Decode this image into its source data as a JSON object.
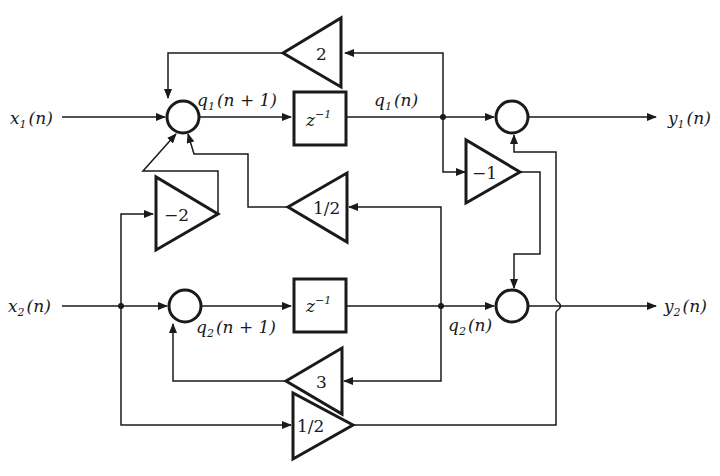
{
  "diagram": {
    "type": "state-variable block diagram (two inputs, two outputs, two delays)",
    "inputs": [
      {
        "var": "x",
        "sub": "1",
        "arg": "(n)"
      },
      {
        "var": "x",
        "sub": "2",
        "arg": "(n)"
      }
    ],
    "outputs": [
      {
        "var": "y",
        "sub": "1",
        "arg": "(n)"
      },
      {
        "var": "y",
        "sub": "2",
        "arg": "(n)"
      }
    ],
    "states": {
      "q1_next": {
        "var": "q",
        "sub": "1",
        "arg": "(n + 1)"
      },
      "q1": {
        "var": "q",
        "sub": "1",
        "arg": "(n)"
      },
      "q2_next": {
        "var": "q",
        "sub": "2",
        "arg": "(n + 1)"
      },
      "q2": {
        "var": "q",
        "sub": "2",
        "arg": "(n)"
      }
    },
    "delays": [
      {
        "label": "z",
        "exp": "−1"
      },
      {
        "label": "z",
        "exp": "−1"
      }
    ],
    "gains": {
      "g_q1_to_s1": "2",
      "g_q2_to_s1": "1/2",
      "g_x2_to_s1": "−2",
      "g_q1_to_out2": "−1",
      "g_q2_to_s2": "3",
      "g_x2_to_out1": "1/2"
    },
    "equations": [
      "q1(n+1) = 2 q1(n) + 1/2 q2(n) + x1(n) − 2 x2(n)",
      "q2(n+1) = 3 q2(n) + x2(n)",
      "y1(n) = q1(n) + 1/2 x2(n)",
      "y2(n) = q2(n) − q1(n)"
    ]
  }
}
